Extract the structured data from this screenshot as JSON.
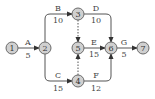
{
  "diagram": {
    "type": "activity-on-arrow network",
    "nodes": [
      {
        "id": "1",
        "label": "1",
        "x": 12,
        "y": 48
      },
      {
        "id": "2",
        "label": "2",
        "x": 45,
        "y": 48
      },
      {
        "id": "3",
        "label": "3",
        "x": 78,
        "y": 14
      },
      {
        "id": "4",
        "label": "4",
        "x": 78,
        "y": 81
      },
      {
        "id": "5",
        "label": "5",
        "x": 78,
        "y": 48
      },
      {
        "id": "6",
        "label": "6",
        "x": 111,
        "y": 48
      },
      {
        "id": "7",
        "label": "7",
        "x": 143,
        "y": 48
      }
    ],
    "activities": [
      {
        "id": "A",
        "name": "A",
        "duration": "5",
        "from": "1",
        "to": "2"
      },
      {
        "id": "B",
        "name": "B",
        "duration": "10",
        "from": "2",
        "to": "3"
      },
      {
        "id": "C",
        "name": "C",
        "duration": "15",
        "from": "2",
        "to": "4"
      },
      {
        "id": "D",
        "name": "D",
        "duration": "10",
        "from": "3",
        "to": "6"
      },
      {
        "id": "E",
        "name": "E",
        "duration": "15",
        "from": "5",
        "to": "6"
      },
      {
        "id": "F",
        "name": "F",
        "duration": "12",
        "from": "4",
        "to": "6"
      },
      {
        "id": "G",
        "name": "G",
        "duration": "5",
        "from": "6",
        "to": "7"
      }
    ],
    "dummies": [
      {
        "from": "3",
        "to": "5"
      },
      {
        "from": "4",
        "to": "5"
      }
    ]
  }
}
